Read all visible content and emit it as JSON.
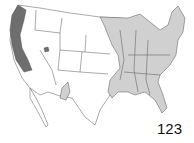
{
  "map": {
    "label": "123",
    "legend": {
      "dark_range_color": "#6e6e6e",
      "light_range_color": "#d0d0d0",
      "outside_range_color": "#ffffff",
      "border_color": "#555555"
    },
    "regions": {
      "dark": [
        "west-coast-strip",
        "southeast-idaho-spot"
      ],
      "light": [
        "eastern-us",
        "texas-patch"
      ]
    }
  }
}
